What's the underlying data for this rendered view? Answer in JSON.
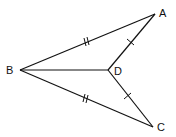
{
  "diagram": {
    "type": "geometry",
    "points": {
      "A": {
        "label": "A",
        "x": 155,
        "y": 14
      },
      "B": {
        "label": "B",
        "x": 20,
        "y": 70
      },
      "C": {
        "label": "C",
        "x": 153,
        "y": 127
      },
      "D": {
        "label": "D",
        "x": 108,
        "y": 70
      }
    },
    "segments": [
      {
        "from": "B",
        "to": "A",
        "ticks": 2
      },
      {
        "from": "B",
        "to": "C",
        "ticks": 2
      },
      {
        "from": "D",
        "to": "A",
        "ticks": 1
      },
      {
        "from": "D",
        "to": "C",
        "ticks": 1
      },
      {
        "from": "B",
        "to": "D",
        "ticks": 0
      }
    ],
    "stroke_color": "#111111"
  }
}
